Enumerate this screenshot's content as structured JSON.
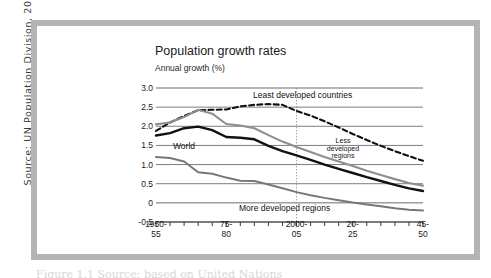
{
  "source_note": "Source: UN Population Division, 2003.",
  "bottom_caption": "Figure 1.1  Source: based on United Nations",
  "chart_data": {
    "type": "line",
    "title": "Population growth rates",
    "subtitle": "Annual growth (%)",
    "xlabel": "",
    "ylabel": "Annual growth (%)",
    "ylim": [
      -0.5,
      3.0
    ],
    "ytick_values": [
      3.0,
      2.5,
      2.0,
      1.5,
      1.0,
      0.5,
      0,
      -0.5
    ],
    "ytick_labels": [
      "3.0",
      "2.5",
      "2.0",
      "1.5",
      "1.0",
      "0.5",
      "0",
      "-0.5"
    ],
    "grid": true,
    "legend_position": "inline-annotations",
    "x": [
      "1950-55",
      "1955-60",
      "1960-65",
      "1965-70",
      "1970-75",
      "1975-80",
      "1980-85",
      "1985-90",
      "1990-95",
      "1995-00",
      "2000-05",
      "2005-10",
      "2010-15",
      "2015-20",
      "2020-25",
      "2025-30",
      "2030-35",
      "2035-40",
      "2040-45",
      "2045-50"
    ],
    "xtick_labels": [
      {
        "index": 0,
        "line1": "1950-",
        "line2": "55"
      },
      {
        "index": 5,
        "line1": "75-",
        "line2": "80"
      },
      {
        "index": 10,
        "line1": "2000-",
        "line2": "05"
      },
      {
        "index": 14,
        "line1": "20-",
        "line2": "25"
      },
      {
        "index": 19,
        "line1": "45-",
        "line2": "50"
      }
    ],
    "marker_line": {
      "label": "2000-05",
      "index": 10,
      "style": "dotted"
    },
    "series": [
      {
        "name": "Least developed countries",
        "color": "#111111",
        "style": "dashed",
        "width": 2.1,
        "values": [
          1.88,
          2.1,
          2.27,
          2.42,
          2.43,
          2.44,
          2.52,
          2.56,
          2.58,
          2.56,
          2.4,
          2.28,
          2.13,
          1.97,
          1.8,
          1.64,
          1.49,
          1.35,
          1.22,
          1.1
        ]
      },
      {
        "name": "Less developed regions",
        "color": "#8e8e8e",
        "style": "solid",
        "width": 2.1,
        "values": [
          2.05,
          2.1,
          2.24,
          2.43,
          2.33,
          2.06,
          2.02,
          1.95,
          1.77,
          1.6,
          1.46,
          1.33,
          1.2,
          1.08,
          0.96,
          0.84,
          0.73,
          0.62,
          0.52,
          0.45
        ]
      },
      {
        "name": "World",
        "color": "#111111",
        "style": "solid",
        "width": 2.4,
        "values": [
          1.76,
          1.82,
          1.95,
          1.99,
          1.9,
          1.72,
          1.7,
          1.66,
          1.49,
          1.35,
          1.24,
          1.12,
          1.0,
          0.89,
          0.78,
          0.67,
          0.57,
          0.47,
          0.38,
          0.31
        ]
      },
      {
        "name": "More developed regions",
        "color": "#777777",
        "style": "solid",
        "width": 2.0,
        "values": [
          1.2,
          1.17,
          1.08,
          0.8,
          0.76,
          0.66,
          0.58,
          0.57,
          0.48,
          0.38,
          0.28,
          0.2,
          0.13,
          0.07,
          0.01,
          -0.04,
          -0.09,
          -0.14,
          -0.18,
          -0.2
        ]
      }
    ],
    "annotations": [
      {
        "name": "least-developed-countries",
        "text": "Least developed countries"
      },
      {
        "name": "less-developed-regions",
        "text": "Less developed regions"
      },
      {
        "name": "world",
        "text": "World"
      },
      {
        "name": "more-developed-regions",
        "text": "More developed regions"
      }
    ]
  }
}
